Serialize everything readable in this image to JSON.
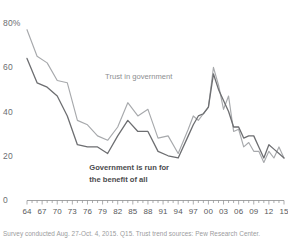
{
  "chart_data": {
    "type": "line",
    "title": "",
    "xlabel": "",
    "ylabel": "",
    "ylim": [
      0,
      85
    ],
    "yticks": [
      0,
      20,
      40,
      60,
      80
    ],
    "ytick_labels": [
      "0",
      "20",
      "40",
      "60",
      "80%"
    ],
    "grid": false,
    "legend_position": "inline-annotation",
    "xlim": [
      1964,
      2015
    ],
    "xticks": [
      1964,
      1967,
      1970,
      1973,
      1976,
      1979,
      1982,
      1985,
      1988,
      1991,
      1994,
      1997,
      2000,
      2003,
      2006,
      2009,
      2012,
      2015
    ],
    "xtick_labels": [
      "64",
      "67",
      "70",
      "73",
      "76",
      "79",
      "82",
      "85",
      "88",
      "91",
      "94",
      "97",
      "00",
      "03",
      "06",
      "09",
      "12",
      "15"
    ],
    "annotations": [
      {
        "text": "Trust in government",
        "series": "Trust in government",
        "style": "light",
        "x_pct": 36.5,
        "y_pct": 32.5
      },
      {
        "text": "Government is run for",
        "series": "Government is run for the benefit of all",
        "style": "dark",
        "x_pct": 31.0,
        "y_pct": 69.5
      },
      {
        "text": "the benefit of all",
        "series": "Government is run for the benefit of all",
        "style": "dark",
        "x_pct": 31.0,
        "y_pct": 74.5
      }
    ],
    "series": [
      {
        "name": "Trust in government",
        "color": "#a7a9ac",
        "points": [
          [
            1964,
            77
          ],
          [
            1966,
            65
          ],
          [
            1968,
            62
          ],
          [
            1970,
            54
          ],
          [
            1972,
            53
          ],
          [
            1974,
            36
          ],
          [
            1976,
            34
          ],
          [
            1978,
            29
          ],
          [
            1980,
            27
          ],
          [
            1982,
            33
          ],
          [
            1984,
            44
          ],
          [
            1986,
            38
          ],
          [
            1988,
            41
          ],
          [
            1990,
            28
          ],
          [
            1992,
            29
          ],
          [
            1994,
            21
          ],
          [
            1996,
            32
          ],
          [
            1997,
            38
          ],
          [
            1998,
            36
          ],
          [
            1999,
            39
          ],
          [
            2000,
            42
          ],
          [
            2001,
            60
          ],
          [
            2002,
            52
          ],
          [
            2003,
            41
          ],
          [
            2004,
            47
          ],
          [
            2005,
            31
          ],
          [
            2006,
            32
          ],
          [
            2007,
            24
          ],
          [
            2008,
            26
          ],
          [
            2009,
            22
          ],
          [
            2010,
            22
          ],
          [
            2011,
            17
          ],
          [
            2012,
            22
          ],
          [
            2013,
            19
          ],
          [
            2014,
            24
          ],
          [
            2015,
            19
          ]
        ]
      },
      {
        "name": "Government is run for the benefit of all",
        "color": "#6d6e71",
        "points": [
          [
            1964,
            64
          ],
          [
            1966,
            53
          ],
          [
            1968,
            51
          ],
          [
            1970,
            47
          ],
          [
            1972,
            38
          ],
          [
            1974,
            25
          ],
          [
            1976,
            24
          ],
          [
            1978,
            24
          ],
          [
            1980,
            21
          ],
          [
            1982,
            29
          ],
          [
            1984,
            36
          ],
          [
            1986,
            31
          ],
          [
            1988,
            31
          ],
          [
            1990,
            22
          ],
          [
            1992,
            20
          ],
          [
            1994,
            19
          ],
          [
            1996,
            29
          ],
          [
            1997,
            34
          ],
          [
            1998,
            38
          ],
          [
            1999,
            39
          ],
          [
            2000,
            42
          ],
          [
            2001,
            57
          ],
          [
            2002,
            50
          ],
          [
            2003,
            45
          ],
          [
            2004,
            40
          ],
          [
            2005,
            33
          ],
          [
            2006,
            33
          ],
          [
            2007,
            28
          ],
          [
            2008,
            29
          ],
          [
            2009,
            29
          ],
          [
            2010,
            24
          ],
          [
            2011,
            19
          ],
          [
            2012,
            25
          ],
          [
            2013,
            23
          ],
          [
            2014,
            21
          ],
          [
            2015,
            19
          ]
        ]
      }
    ]
  },
  "footnote": "Survey conducted Aug. 27-Oct. 4, 2015. Q15. Trust trend sources: Pew Research Center.",
  "axis": {
    "y_label_80": "80%",
    "y_label_60": "60",
    "y_label_40": "40",
    "y_label_20": "20",
    "y_label_0": "0"
  }
}
